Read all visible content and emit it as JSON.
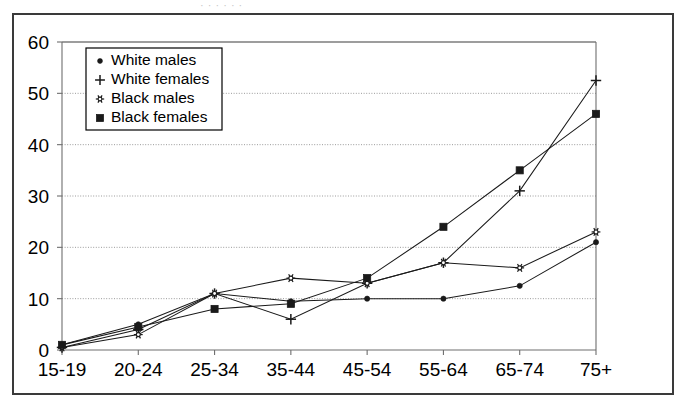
{
  "figure": {
    "top_partial_text": "·  ·   · ·  ·   ·",
    "border_color": "#3a3a3a",
    "background": "#ffffff",
    "gridline_color": "#9b9b9b",
    "series_color": "#1a1a1a"
  },
  "chart_data": {
    "type": "line",
    "title": "",
    "subtitle": "",
    "xlabel": "",
    "ylabel": "",
    "categories": [
      "15-19",
      "20-24",
      "25-34",
      "35-44",
      "45-54",
      "55-64",
      "65-74",
      "75+"
    ],
    "ylim": [
      0,
      60
    ],
    "yticks": [
      0,
      10,
      20,
      30,
      40,
      50,
      60
    ],
    "grid": "horizontal",
    "legend_position": "top-left inside plot",
    "series": [
      {
        "name": "White males",
        "marker": "small-filled-circle",
        "values": [
          1,
          5,
          11,
          9.5,
          10,
          10,
          12.5,
          21
        ]
      },
      {
        "name": "White females",
        "marker": "plus",
        "values": [
          0.5,
          4,
          11,
          6,
          13,
          17,
          31,
          52.5
        ]
      },
      {
        "name": "Black males",
        "marker": "open-star",
        "values": [
          0.5,
          3,
          11,
          14,
          13,
          17,
          16,
          23
        ]
      },
      {
        "name": "Black females",
        "marker": "filled-square",
        "values": [
          1,
          4.5,
          8,
          9,
          14,
          24,
          35,
          46
        ]
      }
    ]
  },
  "legend": {
    "entries": [
      {
        "label": "White males",
        "marker": "small-filled-circle"
      },
      {
        "label": "White females",
        "marker": "plus"
      },
      {
        "label": "Black males",
        "marker": "open-star"
      },
      {
        "label": "Black females",
        "marker": "filled-square"
      }
    ]
  },
  "y_axis": {
    "ticks": [
      "0",
      "10",
      "20",
      "30",
      "40",
      "50",
      "60"
    ]
  },
  "x_axis": {
    "ticks": [
      "15-19",
      "20-24",
      "25-34",
      "35-44",
      "45-54",
      "55-64",
      "65-74",
      "75+"
    ]
  }
}
